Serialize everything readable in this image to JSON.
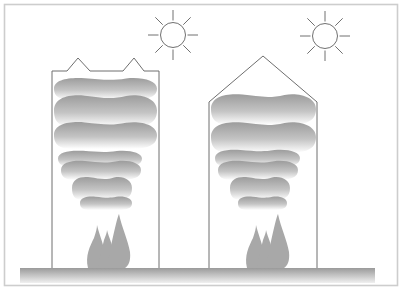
{
  "figure": {
    "width": 402,
    "height": 290,
    "background": "#ffffff",
    "frame": {
      "x": 4.5,
      "y": 4.5,
      "w": 393,
      "h": 281,
      "color": "#cdcdcd"
    }
  },
  "colors": {
    "line": "#6e6e6e",
    "sun_line": "#707070",
    "smoke_top": "#9c9c9c",
    "smoke_mid": "#c4c4c4",
    "smoke_bottom": "#ffffff",
    "flame": "#a8a8a8",
    "ground_top": "#9a9a9a",
    "ground_bottom": "#f0f0f0"
  },
  "ground": {
    "x": 20,
    "y": 268,
    "w": 355,
    "h": 15
  },
  "scenes": [
    {
      "id": "left",
      "label": "vented-roof-enclosure",
      "sun": {
        "cx": 173,
        "cy": 35,
        "r": 12.5,
        "ray_inner": 14.5,
        "ray_outer": 25
      },
      "walls": "52,268 52,71 67,71 78,58 90,71 123,71 134,58 144,71 159,71 159,268",
      "clip": "53,268 53,72 158,72 158,268",
      "clouds": [
        [
          54,
          77,
          157,
          100
        ],
        [
          54,
          94,
          157,
          127
        ],
        [
          54,
          121,
          157,
          149
        ],
        [
          58,
          150,
          142,
          167
        ],
        [
          61,
          160,
          141,
          180
        ],
        [
          72,
          176,
          132,
          200
        ],
        [
          80,
          196,
          132,
          210
        ]
      ],
      "flame_offset": 0
    },
    {
      "id": "right",
      "label": "gable-roof-enclosure",
      "sun": {
        "cx": 325,
        "cy": 36,
        "r": 12.5,
        "ray_inner": 14.5,
        "ray_outer": 25
      },
      "walls": "209,268 209,102 263,56 317,102 317,268",
      "clip": "210,268 210,102 263,57 316,102 316,268",
      "clouds": [
        [
          211,
          93,
          316,
          125
        ],
        [
          211,
          121,
          316,
          153
        ],
        [
          215,
          149,
          300,
          167
        ],
        [
          218,
          160,
          298,
          180
        ],
        [
          230,
          176,
          290,
          200
        ],
        [
          238,
          196,
          287,
          210
        ]
      ],
      "flame_offset": 159
    }
  ],
  "flames": [
    "M88,268 C85,256 90,246 94,238 C96,232 97,228 97,225 C99,234 103,242 104,250 C106,258 104,264 101,268 Z",
    "M98,268 C100,258 102,248 104,240 C106,235 107,232 107,230 C109,238 113,245 114,255 C115,262 113,266 111,268 Z",
    "M107,268 C109,256 112,240 115,228 C117,220 118,216 119,214 C122,228 128,240 130,252 C131,262 128,266 125,268 Z"
  ]
}
